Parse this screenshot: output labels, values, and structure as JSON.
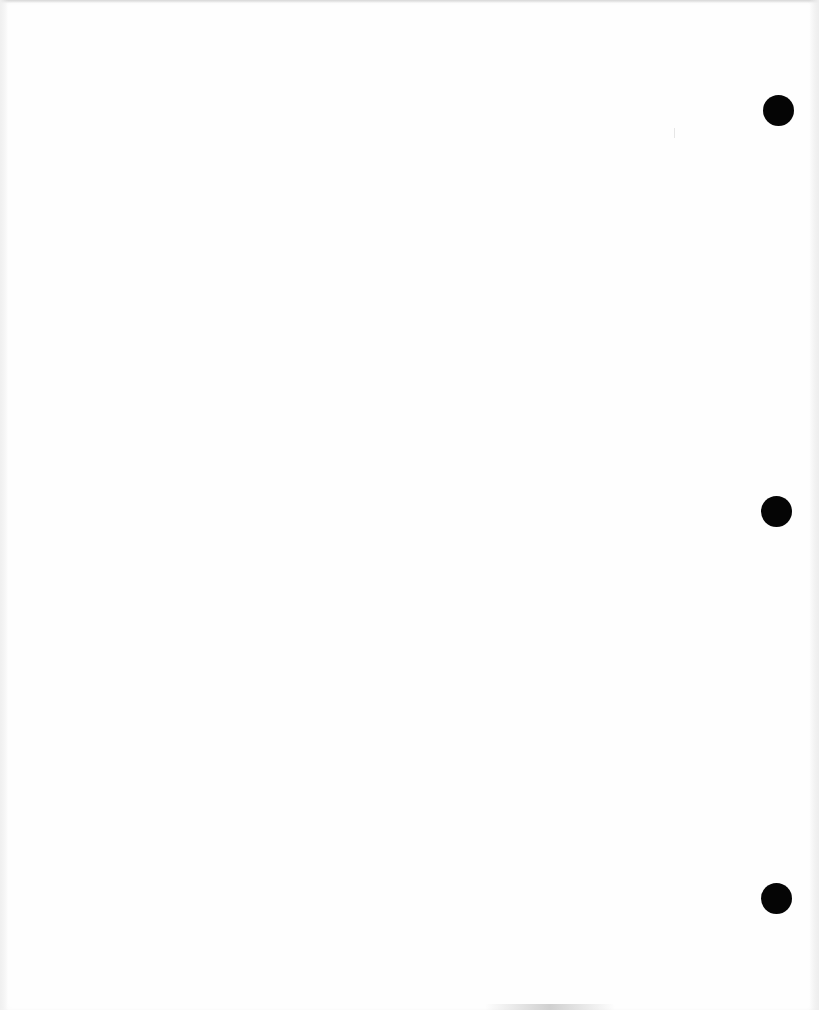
{
  "document": {
    "type": "blank scanned page",
    "text": "",
    "punch_holes": [
      {
        "id": "top",
        "cx": 778,
        "cy": 110,
        "r": 15,
        "color": "#050505"
      },
      {
        "id": "middle",
        "cx": 776,
        "cy": 511,
        "r": 15,
        "color": "#050505"
      },
      {
        "id": "bottom",
        "cx": 776,
        "cy": 898,
        "r": 15,
        "color": "#050505"
      }
    ],
    "paper_color": "#fefefe"
  }
}
